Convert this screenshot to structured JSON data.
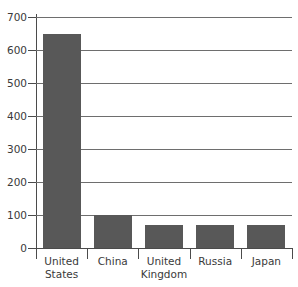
{
  "chart_data": {
    "type": "bar",
    "title": "",
    "subtitle": "",
    "xlabel": "",
    "ylabel": "",
    "categories": [
      "United States",
      "China",
      "United Kingdom",
      "Russia",
      "Japan"
    ],
    "values": [
      650,
      100,
      70,
      70,
      70
    ],
    "ylim": [
      0,
      700
    ],
    "yticks": [
      0,
      100,
      200,
      300,
      400,
      500,
      600,
      700
    ],
    "ytick_labels": [
      "0",
      "100",
      "200",
      "300",
      "400",
      "500",
      "600",
      "700"
    ],
    "grid": true,
    "grid_axis": "y",
    "legend": false,
    "legend_position": "none",
    "series": [
      {
        "name": "",
        "values": [
          650,
          100,
          70,
          70,
          70
        ]
      }
    ],
    "colors": {
      "bar": "#585858",
      "axis": "#4b4b4b",
      "grid": "#6e6e6e",
      "text": "#3a3a3a",
      "background": "#ffffff"
    }
  }
}
